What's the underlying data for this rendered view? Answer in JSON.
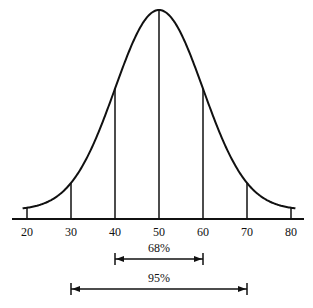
{
  "diagram": {
    "mean": 50,
    "sd": 10,
    "x_ticks": [
      "20",
      "30",
      "40",
      "50",
      "60",
      "70",
      "80"
    ],
    "vertical_lines_at": [
      30,
      40,
      50,
      60,
      70
    ],
    "end_ticks_at": [
      20,
      80
    ],
    "ranges": [
      {
        "label": "68%",
        "from": 40,
        "to": 60
      },
      {
        "label": "95%",
        "from": 30,
        "to": 70
      }
    ],
    "colors": {
      "line": "#111111",
      "background": "#ffffff"
    }
  }
}
